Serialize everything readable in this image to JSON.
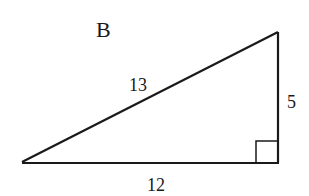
{
  "figure": {
    "label": "B",
    "sides": {
      "hypotenuse": "13",
      "vertical_leg": "5",
      "horizontal_leg": "12"
    },
    "right_angle_marker": "square",
    "stroke_color": "#1a1a1a"
  }
}
